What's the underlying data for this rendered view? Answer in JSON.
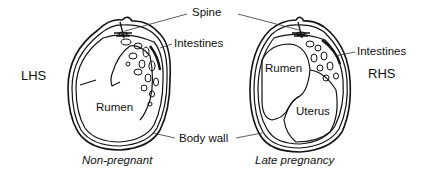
{
  "figure": {
    "labels": {
      "spine": "Spine",
      "intestines_left": "Intestines",
      "intestines_right": "Intestines",
      "body_wall": "Body wall",
      "rumen_left": "Rumen",
      "rumen_right": "Rumen",
      "uterus": "Uterus",
      "lhs": "LHS",
      "rhs": "RHS"
    },
    "captions": {
      "left": "Non-pregnant",
      "right": "Late pregnancy"
    },
    "colors": {
      "line": "#111111",
      "background": "#ffffff"
    }
  }
}
